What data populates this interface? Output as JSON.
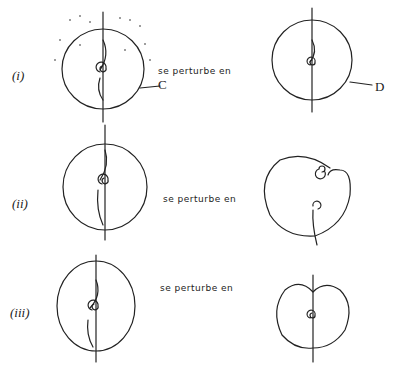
{
  "rows": [
    {
      "label": "(i)",
      "text": "se perturbe en",
      "curve_left": "C",
      "curve_right": "D"
    },
    {
      "label": "(ii)",
      "text": "se perturbe en"
    },
    {
      "label": "(iii)",
      "text": "se perturbe en"
    }
  ],
  "colors": {
    "ink": "#222222",
    "background": "#ffffff"
  }
}
